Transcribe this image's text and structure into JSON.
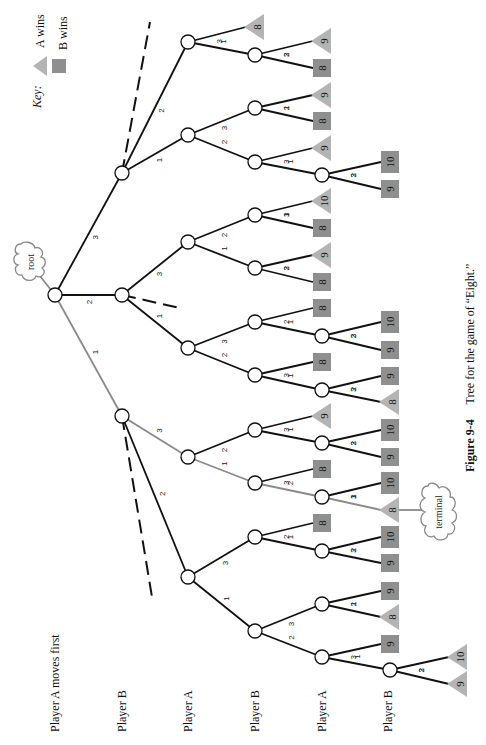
{
  "figure": {
    "number": "Figure 9-4",
    "caption": "Tree for the game of “Eight.”",
    "orientation": "page rotated 90° counter-clockwise; tree grows left to right"
  },
  "key": {
    "title": "Key:",
    "items": [
      {
        "shape": "triangle",
        "label": "A wins",
        "color": "#b4b4b4"
      },
      {
        "shape": "square",
        "label": "B wins",
        "color": "#8f8f8f"
      }
    ]
  },
  "player_labels": [
    {
      "text": "Player A moves first",
      "x": 55
    },
    {
      "text": "Player B",
      "x": 122
    },
    {
      "text": "Player A",
      "x": 188
    },
    {
      "text": "Player B",
      "x": 255
    },
    {
      "text": "Player A",
      "x": 322
    },
    {
      "text": "Player B",
      "x": 388
    }
  ],
  "callouts": {
    "root": "root",
    "terminal": "terminal"
  },
  "colors": {
    "line": "#111111",
    "highlight_path": "#8a8a8a",
    "a_wins": "#b4b4b4",
    "b_wins": "#8f8f8f"
  },
  "tree": {
    "nodes": [
      {
        "id": "r",
        "x": 55,
        "y": 295
      },
      {
        "id": "n3",
        "x": 122,
        "y": 173
      },
      {
        "id": "n2",
        "x": 122,
        "y": 295
      },
      {
        "id": "n1",
        "x": 122,
        "y": 416
      },
      {
        "id": "n32",
        "x": 188,
        "y": 42
      },
      {
        "id": "n31",
        "x": 188,
        "y": 135
      },
      {
        "id": "n23",
        "x": 188,
        "y": 242
      },
      {
        "id": "n21",
        "x": 188,
        "y": 348
      },
      {
        "id": "n13",
        "x": 188,
        "y": 457
      },
      {
        "id": "n12",
        "x": 188,
        "y": 577
      },
      {
        "id": "a1",
        "x": 255,
        "y": 55
      },
      {
        "id": "a2",
        "x": 255,
        "y": 108
      },
      {
        "id": "a3",
        "x": 255,
        "y": 162
      },
      {
        "id": "a4",
        "x": 255,
        "y": 215
      },
      {
        "id": "a5",
        "x": 255,
        "y": 268
      },
      {
        "id": "a6",
        "x": 255,
        "y": 322
      },
      {
        "id": "a7",
        "x": 255,
        "y": 375
      },
      {
        "id": "a8",
        "x": 255,
        "y": 430
      },
      {
        "id": "a9",
        "x": 255,
        "y": 483
      },
      {
        "id": "a10",
        "x": 255,
        "y": 537
      },
      {
        "id": "a11",
        "x": 255,
        "y": 631
      },
      {
        "id": "b1",
        "x": 322,
        "y": 175
      },
      {
        "id": "b2",
        "x": 322,
        "y": 336
      },
      {
        "id": "b3",
        "x": 322,
        "y": 390
      },
      {
        "id": "b4",
        "x": 322,
        "y": 443
      },
      {
        "id": "b5",
        "x": 322,
        "y": 497
      },
      {
        "id": "b6",
        "x": 322,
        "y": 551
      },
      {
        "id": "b7",
        "x": 322,
        "y": 604
      },
      {
        "id": "b8",
        "x": 322,
        "y": 657
      },
      {
        "id": "c1",
        "x": 390,
        "y": 670
      }
    ],
    "edges": [
      {
        "from": "r",
        "to": "n3",
        "label": "3"
      },
      {
        "from": "r",
        "to": "n2",
        "label": "2"
      },
      {
        "from": "r",
        "to": "n1",
        "label": "1",
        "path": true
      },
      {
        "from": "n3",
        "to": "n32",
        "label": "2"
      },
      {
        "from": "n3",
        "to": "n31",
        "label": "1"
      },
      {
        "from": "n2",
        "to": "n23",
        "label": "3"
      },
      {
        "from": "n2",
        "to": "n21",
        "label": "1"
      },
      {
        "from": "n1",
        "to": "n13",
        "label": "3",
        "path": true
      },
      {
        "from": "n1",
        "to": "n12",
        "label": "2"
      },
      {
        "from": "n32",
        "to": "a1",
        "label": "1"
      },
      {
        "from": "n31",
        "to": "a2",
        "label": "3"
      },
      {
        "from": "n31",
        "to": "a3",
        "label": "2"
      },
      {
        "from": "n23",
        "to": "a4",
        "label": "2"
      },
      {
        "from": "n23",
        "to": "a5",
        "label": "1"
      },
      {
        "from": "n21",
        "to": "a6",
        "label": "3"
      },
      {
        "from": "n21",
        "to": "a7",
        "label": "2"
      },
      {
        "from": "n13",
        "to": "a8",
        "label": "2"
      },
      {
        "from": "n13",
        "to": "a9",
        "label": "1",
        "path": true
      },
      {
        "from": "n12",
        "to": "a10",
        "label": "3"
      },
      {
        "from": "n12",
        "to": "a11",
        "label": "1"
      },
      {
        "from": "a3",
        "to": "b1",
        "label": "1"
      },
      {
        "from": "a6",
        "to": "b2",
        "label": "1"
      },
      {
        "from": "a7",
        "to": "b3",
        "label": "1"
      },
      {
        "from": "a8",
        "to": "b4",
        "label": "1"
      },
      {
        "from": "a9",
        "to": "b5",
        "label": "2",
        "path": true
      },
      {
        "from": "a10",
        "to": "b6",
        "label": "1"
      },
      {
        "from": "a11",
        "to": "b7",
        "label": "3"
      },
      {
        "from": "a11",
        "to": "b8",
        "label": "2"
      },
      {
        "from": "b8",
        "to": "c1",
        "label": "1"
      }
    ],
    "leaves": [
      {
        "parent": "n32",
        "x": 255,
        "y": 27,
        "value": "8",
        "winner": "A",
        "edge": "3"
      },
      {
        "parent": "a1",
        "x": 322,
        "y": 41,
        "value": "9",
        "winner": "A",
        "edge": "3"
      },
      {
        "parent": "a1",
        "x": 322,
        "y": 68,
        "value": "8",
        "winner": "B",
        "edge": "2"
      },
      {
        "parent": "a2",
        "x": 322,
        "y": 95,
        "value": "9",
        "winner": "A",
        "edge": "2"
      },
      {
        "parent": "a2",
        "x": 322,
        "y": 121,
        "value": "8",
        "winner": "B",
        "edge": "1"
      },
      {
        "parent": "a3",
        "x": 322,
        "y": 148,
        "value": "9",
        "winner": "A",
        "edge": "3"
      },
      {
        "parent": "b1",
        "x": 390,
        "y": 162,
        "value": "10",
        "winner": "B",
        "edge": "3"
      },
      {
        "parent": "b1",
        "x": 390,
        "y": 189,
        "value": "9",
        "winner": "B",
        "edge": "2"
      },
      {
        "parent": "a4",
        "x": 322,
        "y": 201,
        "value": "10",
        "winner": "A",
        "edge": "3"
      },
      {
        "parent": "a4",
        "x": 322,
        "y": 228,
        "value": "8",
        "winner": "B",
        "edge": "1"
      },
      {
        "parent": "a5",
        "x": 322,
        "y": 255,
        "value": "9",
        "winner": "A",
        "edge": "3"
      },
      {
        "parent": "a5",
        "x": 322,
        "y": 282,
        "value": "8",
        "winner": "B",
        "edge": "2"
      },
      {
        "parent": "a6",
        "x": 322,
        "y": 308,
        "value": "8",
        "winner": "B",
        "edge": "2"
      },
      {
        "parent": "b2",
        "x": 390,
        "y": 322,
        "value": "10",
        "winner": "B",
        "edge": "3"
      },
      {
        "parent": "b2",
        "x": 390,
        "y": 350,
        "value": "9",
        "winner": "B",
        "edge": "2"
      },
      {
        "parent": "a7",
        "x": 322,
        "y": 362,
        "value": "8",
        "winner": "B",
        "edge": "3"
      },
      {
        "parent": "b3",
        "x": 390,
        "y": 376,
        "value": "9",
        "winner": "B",
        "edge": "3"
      },
      {
        "parent": "b3",
        "x": 390,
        "y": 402,
        "value": "8",
        "winner": "A",
        "edge": "2"
      },
      {
        "parent": "a8",
        "x": 322,
        "y": 416,
        "value": "9",
        "winner": "A",
        "edge": "3"
      },
      {
        "parent": "b4",
        "x": 390,
        "y": 430,
        "value": "10",
        "winner": "B",
        "edge": "3"
      },
      {
        "parent": "b4",
        "x": 390,
        "y": 457,
        "value": "9",
        "winner": "B",
        "edge": "2"
      },
      {
        "parent": "a9",
        "x": 322,
        "y": 469,
        "value": "8",
        "winner": "B",
        "edge": "3"
      },
      {
        "parent": "b5",
        "x": 390,
        "y": 483,
        "value": "10",
        "winner": "B",
        "edge": "3"
      },
      {
        "parent": "b5",
        "x": 390,
        "y": 510,
        "value": "8",
        "winner": "A",
        "edge": "1",
        "path": true,
        "terminal": true
      },
      {
        "parent": "a10",
        "x": 322,
        "y": 523,
        "value": "8",
        "winner": "B",
        "edge": "2"
      },
      {
        "parent": "b6",
        "x": 390,
        "y": 537,
        "value": "10",
        "winner": "B",
        "edge": "3"
      },
      {
        "parent": "b6",
        "x": 390,
        "y": 563,
        "value": "9",
        "winner": "B",
        "edge": "2"
      },
      {
        "parent": "b7",
        "x": 390,
        "y": 591,
        "value": "9",
        "winner": "B",
        "edge": "2"
      },
      {
        "parent": "b7",
        "x": 390,
        "y": 617,
        "value": "8",
        "winner": "A",
        "edge": "1"
      },
      {
        "parent": "b8",
        "x": 390,
        "y": 644,
        "value": "9",
        "winner": "B",
        "edge": "3"
      },
      {
        "parent": "c1",
        "x": 458,
        "y": 657,
        "value": "10",
        "winner": "A",
        "edge": "3"
      },
      {
        "parent": "c1",
        "x": 458,
        "y": 684,
        "value": "9",
        "winner": "A",
        "edge": "2"
      }
    ],
    "dashed_cuts": [
      {
        "x1": 122,
        "y1": 173,
        "x2": 150,
        "y2": 22
      },
      {
        "x1": 122,
        "y1": 295,
        "x2": 180,
        "y2": 308
      },
      {
        "x1": 122,
        "y1": 416,
        "x2": 152,
        "y2": 597
      }
    ]
  }
}
